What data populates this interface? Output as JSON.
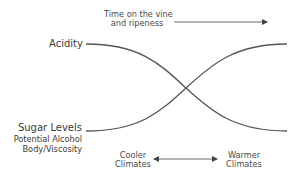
{
  "diagram": {
    "time_axis": {
      "label_line1": "Time on the vine",
      "label_line2": "and ripeness",
      "direction": "right"
    },
    "curves": [
      {
        "name": "Acidity",
        "label": "Acidity",
        "trend": "decreasing",
        "start": [
          86,
          44
        ],
        "end": [
          287,
          131
        ]
      },
      {
        "name": "Sugar Levels",
        "label": "Sugar Levels",
        "trend": "increasing",
        "start": [
          86,
          131
        ],
        "end": [
          287,
          44
        ]
      }
    ],
    "sugar_related": [
      "Potential Alcohol",
      "Body/Viscosity"
    ],
    "climate_axis": {
      "left_line1": "Cooler",
      "left_line2": "Climates",
      "right_line1": "Warmer",
      "right_line2": "Climates",
      "arrow": "bidirectional"
    },
    "colors": {
      "line": "#555555",
      "text": "#3a3a3a"
    }
  }
}
